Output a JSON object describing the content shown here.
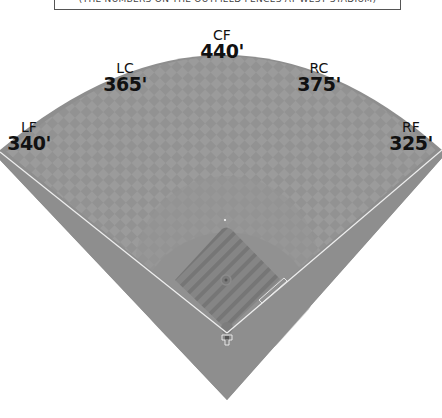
{
  "caption": "(THE NUMBERS ON THE OUTFIELD FENCES AT WEST STADIUM)",
  "colors": {
    "outfield": "#9a9a9a",
    "outfield_dark": "#8c8c8c",
    "warning_track": "#8a8a8a",
    "infield_grass": "#8f8f8f",
    "infield_dirt": "#7f7f7f",
    "foul_line": "#f2f2f2",
    "label_text": "#111111"
  },
  "fences": [
    {
      "position": "LF",
      "distance": "340'"
    },
    {
      "position": "LC",
      "distance": "365'"
    },
    {
      "position": "CF",
      "distance": "440'"
    },
    {
      "position": "RC",
      "distance": "375'"
    },
    {
      "position": "RF",
      "distance": "325'"
    }
  ]
}
